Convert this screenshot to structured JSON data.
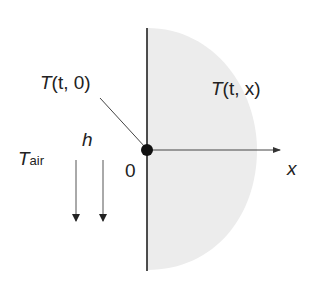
{
  "diagram": {
    "labels": {
      "surface_temp": {
        "symbol": "T",
        "args": "(t, 0)"
      },
      "interior_temp": {
        "symbol": "T",
        "args": "(t, x)"
      },
      "heat_coeff": "h",
      "air_temp": {
        "symbol": "T",
        "subscript": "air"
      },
      "origin": "0",
      "x_axis": "x"
    },
    "colors": {
      "line": "#222222",
      "shading": "#ececec",
      "arrow": "#555555"
    }
  }
}
